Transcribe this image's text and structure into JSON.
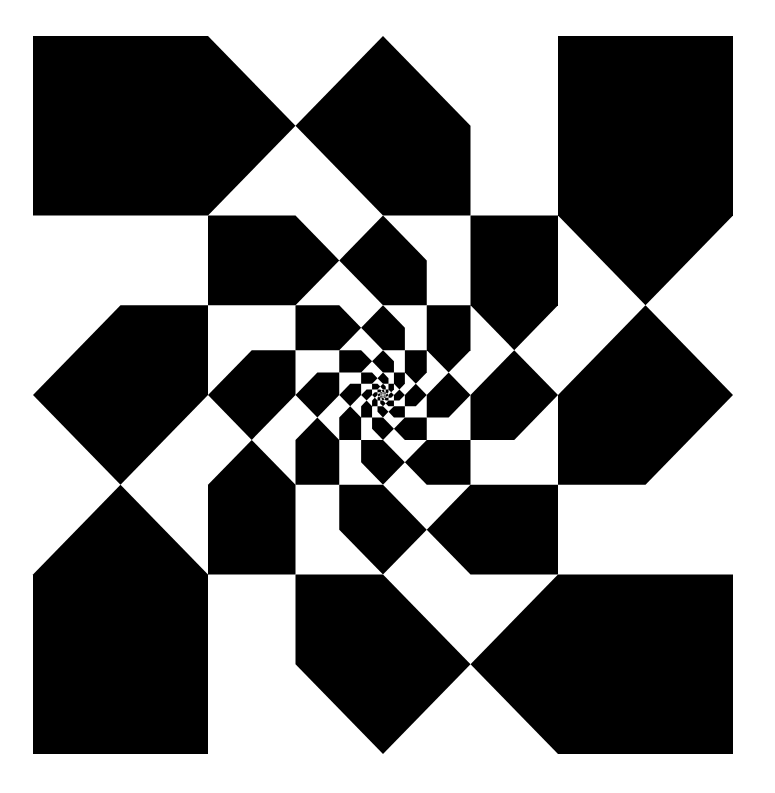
{
  "artwork": {
    "title": "Op-art spiral of nested pentagonal tiles",
    "background": "#ffffff",
    "foreground": "#000000",
    "frame": {
      "x0": 33,
      "y0": 36,
      "x1": 733,
      "y1": 754
    },
    "grid_units": 4,
    "levels": 9,
    "scale_per_level": 0.5,
    "base_tiles": [
      {
        "name": "corner-pentagon",
        "points": [
          [
            0,
            0
          ],
          [
            1,
            0
          ],
          [
            1.5,
            0.5
          ],
          [
            1,
            1
          ],
          [
            0,
            1
          ]
        ]
      },
      {
        "name": "edge-pentagon",
        "points": [
          [
            1.5,
            0.5
          ],
          [
            2,
            0
          ],
          [
            2.5,
            0.5
          ],
          [
            2.5,
            1
          ],
          [
            2,
            1
          ]
        ]
      }
    ],
    "rotations": 4
  }
}
